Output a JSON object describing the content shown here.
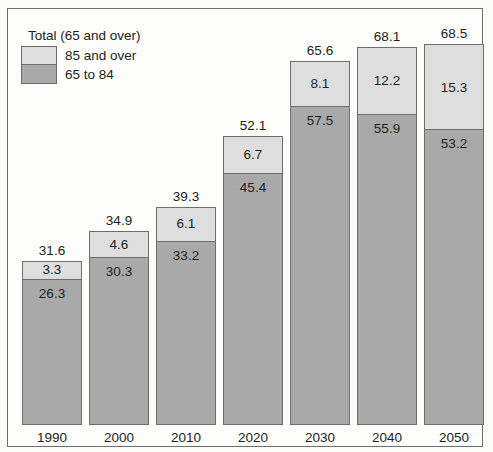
{
  "chart_data": {
    "type": "bar",
    "subtype": "stacked-vertical",
    "title": "",
    "xlabel": "",
    "ylabel": "",
    "grid": false,
    "legend_position": "top-left",
    "legend_title": "Total (65 and over)",
    "categories": [
      "1990",
      "2000",
      "2010",
      "2020",
      "2030",
      "2040",
      "2050"
    ],
    "series": [
      {
        "name": "65 to 84",
        "color": "#a9a9a9",
        "values": [
          26.3,
          30.3,
          33.2,
          45.4,
          57.5,
          55.9,
          53.2
        ]
      },
      {
        "name": "85 and over",
        "color": "#dedede",
        "values": [
          3.3,
          4.6,
          6.1,
          6.7,
          8.1,
          12.2,
          15.3
        ]
      }
    ],
    "totals": [
      31.6,
      34.9,
      39.3,
      52.1,
      65.6,
      68.1,
      68.5
    ],
    "ylim": [
      0,
      72
    ],
    "value_labels": {
      "totals": [
        "31.6",
        "34.9",
        "39.3",
        "52.1",
        "65.6",
        "68.1",
        "68.5"
      ],
      "upper": [
        "3.3",
        "4.6",
        "6.1",
        "6.7",
        "8.1",
        "12.2",
        "15.3"
      ],
      "lower": [
        "26.3",
        "30.3",
        "33.2",
        "45.4",
        "57.5",
        "55.9",
        "53.2"
      ]
    }
  },
  "legend": {
    "title": "Total (65 and over)",
    "items": [
      {
        "label": "85 and over",
        "color": "#dedede"
      },
      {
        "label": "65 to 84",
        "color": "#a9a9a9"
      }
    ]
  },
  "colors": {
    "upper_segment": "#dedede",
    "lower_segment": "#a9a9a9",
    "outline": "#6e6e6e",
    "text": "#231f20",
    "background": "#fdfdfc"
  }
}
